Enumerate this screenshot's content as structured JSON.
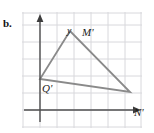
{
  "figure": {
    "part_label": "b.",
    "axis_labels": {
      "x": "x",
      "y": "y"
    },
    "vertices": {
      "M": "M'",
      "Q": "Q'",
      "N": "N'"
    },
    "colors": {
      "grid": "#d8d8dc",
      "axis": "#5a5a5a",
      "triangle": "#8a8a8a",
      "text": "#1a1a1a",
      "background": "#ffffff"
    }
  },
  "chart_data": {
    "type": "scatter",
    "title": "",
    "xlabel": "x",
    "ylabel": "y",
    "grid": true,
    "legend": null,
    "grid_spacing": 17,
    "origin_px": [
      18,
      98
    ],
    "xlim": [
      -1,
      6
    ],
    "ylim": [
      -1,
      6
    ],
    "annotations": [
      {
        "label": "M'",
        "x_px": 48,
        "y_px": 19
      },
      {
        "label": "Q'",
        "x_px": 18,
        "y_px": 67
      },
      {
        "label": "N'",
        "x_px": 108,
        "y_px": 80
      }
    ],
    "series": [
      {
        "name": "triangle M'Q'N'",
        "type": "polygon",
        "closed": true,
        "points_px": [
          [
            48,
            19
          ],
          [
            18,
            67
          ],
          [
            108,
            80
          ]
        ],
        "points": [
          [
            1.8,
            4.6
          ],
          [
            0.0,
            1.8
          ],
          [
            5.3,
            1.05
          ]
        ]
      }
    ]
  }
}
